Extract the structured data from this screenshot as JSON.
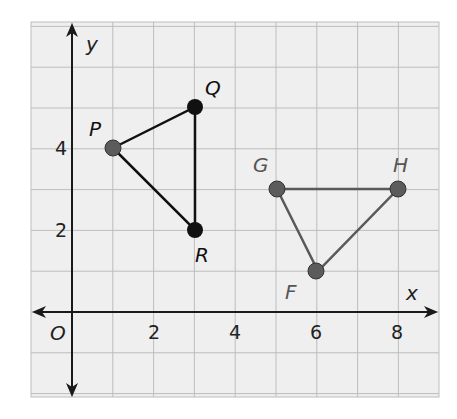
{
  "diagram": {
    "type": "coordinate-plane",
    "axes": {
      "x_label": "x",
      "y_label": "y",
      "origin_label": "O",
      "x_ticks": [
        {
          "value": 2,
          "label": "2"
        },
        {
          "value": 4,
          "label": "4"
        },
        {
          "value": 6,
          "label": "6"
        },
        {
          "value": 8,
          "label": "8"
        }
      ],
      "y_ticks": [
        {
          "value": 2,
          "label": "2"
        },
        {
          "value": 4,
          "label": "4"
        }
      ],
      "x_range": [
        -1,
        9
      ],
      "y_range": [
        -2,
        7
      ]
    },
    "colors": {
      "grid_background": "#efefef",
      "grid_line": "#bdbdbd",
      "axis": "#1a1a1a",
      "triangle_pqr": "#111111",
      "triangle_fgh": "#5a5a5a",
      "point_gray": "#5c5c5c",
      "point_black": "#111111"
    },
    "triangles": [
      {
        "name": "PQR",
        "vertices": [
          {
            "label": "P",
            "x": 1,
            "y": 4,
            "style": "gray"
          },
          {
            "label": "Q",
            "x": 3,
            "y": 5,
            "style": "black"
          },
          {
            "label": "R",
            "x": 3,
            "y": 2,
            "style": "black"
          }
        ]
      },
      {
        "name": "FGH",
        "vertices": [
          {
            "label": "G",
            "x": 5,
            "y": 3,
            "style": "gray"
          },
          {
            "label": "H",
            "x": 8,
            "y": 3,
            "style": "gray"
          },
          {
            "label": "F",
            "x": 6,
            "y": 1,
            "style": "gray"
          }
        ]
      }
    ]
  }
}
